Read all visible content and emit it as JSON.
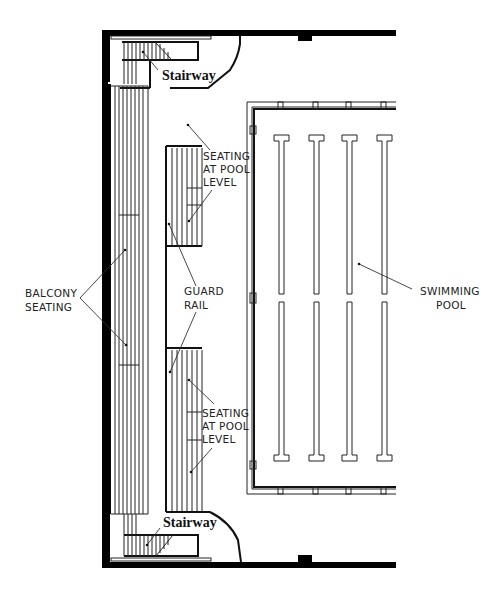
{
  "diagram": {
    "type": "architectural floor plan",
    "colors": {
      "ink": "#000000",
      "background": "#ffffff"
    },
    "labels": {
      "stairway_top": "Stairway",
      "stairway_bottom": "Stairway",
      "seating_pool_top_l1": "SEATING",
      "seating_pool_top_l2": "AT POOL",
      "seating_pool_top_l3": "LEVEL",
      "seating_pool_bottom_l1": "SEATING",
      "seating_pool_bottom_l2": "AT POOL",
      "seating_pool_bottom_l3": "LEVEL",
      "balcony_l1": "BALCONY",
      "balcony_l2": "SEATING",
      "guard_rail_l1": "GUARD",
      "guard_rail_l2": "RAIL",
      "pool_l1": "SWIMMING",
      "pool_l2": "POOL"
    },
    "elements": [
      {
        "name": "balcony-seating",
        "rows": 6
      },
      {
        "name": "seating-at-pool-level-top"
      },
      {
        "name": "seating-at-pool-level-bottom"
      },
      {
        "name": "guard-rail"
      },
      {
        "name": "stairway-top"
      },
      {
        "name": "stairway-bottom"
      },
      {
        "name": "swimming-pool",
        "lane_markers": 4
      }
    ]
  }
}
